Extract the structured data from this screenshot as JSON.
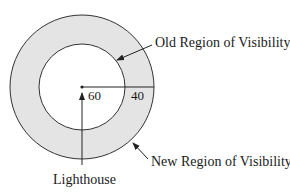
{
  "diagram": {
    "labels": {
      "old_region": "Old Region of Visibility",
      "new_region": "New Region of Visibility",
      "lighthouse": "Lighthouse",
      "inner_radius": "60",
      "ring_width": "40"
    },
    "colors": {
      "ring_fill": "#e4e4e4",
      "stroke": "#333333",
      "background": "#ffffff"
    }
  }
}
